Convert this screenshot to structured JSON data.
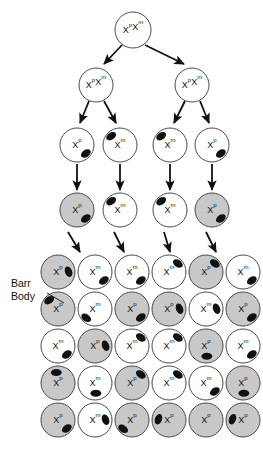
{
  "diagram": {
    "colors": {
      "cell_fill_white": "#ffffff",
      "cell_fill_gray": "#c8c8c8",
      "cell_stroke": "#4a4a4a",
      "barr_body": "#111111",
      "arrow": "#111111",
      "text": "#111111"
    },
    "annotation": {
      "label_line1": "Barr",
      "label_line2": "Body"
    },
    "labels": {
      "xp_xm": "XpXm",
      "xp": "Xp",
      "xm": "Xm"
    },
    "rows": {
      "zygote": [
        {
          "id": "z1",
          "x": 133,
          "y": 30,
          "r": 18,
          "fill": "white",
          "base": "X",
          "sup1": "p",
          "base2": "X",
          "sup2": "m",
          "barr": null
        }
      ],
      "generation1": [
        {
          "id": "g1a",
          "x": 96,
          "y": 85,
          "r": 17,
          "fill": "white",
          "base": "X",
          "sup1": "p",
          "base2": "X",
          "sup2": "m",
          "barr": null
        },
        {
          "id": "g1b",
          "x": 192,
          "y": 85,
          "r": 17,
          "fill": "white",
          "base": "X",
          "sup1": "p",
          "base2": "X",
          "sup2": "m",
          "barr": null
        }
      ],
      "generation2": [
        {
          "id": "g2a",
          "x": 77,
          "y": 145,
          "r": 17,
          "fill": "white",
          "base": "X",
          "sup1": "p",
          "barr": "br"
        },
        {
          "id": "g2b",
          "x": 120,
          "y": 145,
          "r": 17,
          "fill": "white",
          "base": "X",
          "sup1": "m",
          "barr": "tl"
        },
        {
          "id": "g2c",
          "x": 170,
          "y": 145,
          "r": 17,
          "fill": "white",
          "base": "X",
          "sup1": "m",
          "barr": "tl"
        },
        {
          "id": "g2d",
          "x": 212,
          "y": 145,
          "r": 17,
          "fill": "white",
          "base": "X",
          "sup1": "p",
          "barr": "br"
        }
      ],
      "generation3": [
        {
          "id": "g3a",
          "x": 77,
          "y": 210,
          "r": 17,
          "fill": "gray",
          "base": "X",
          "sup1": "p",
          "barr": "br"
        },
        {
          "id": "g3b",
          "x": 120,
          "y": 210,
          "r": 17,
          "fill": "white",
          "base": "X",
          "sup1": "m",
          "barr": "tl"
        },
        {
          "id": "g3c",
          "x": 170,
          "y": 210,
          "r": 17,
          "fill": "white",
          "base": "X",
          "sup1": "m",
          "barr": "tl"
        },
        {
          "id": "g3d",
          "x": 212,
          "y": 210,
          "r": 17,
          "fill": "gray",
          "base": "X",
          "sup1": "p",
          "barr": "br"
        }
      ]
    },
    "tissue_grid": {
      "columns": 6,
      "rows": 5,
      "x_start": 58,
      "x_step": 37,
      "y_start": 272,
      "y_step": 37,
      "radius": 17,
      "cells": [
        [
          {
            "fill": "gray",
            "base": "X",
            "sup1": "p",
            "barr": "r"
          },
          {
            "fill": "white",
            "base": "X",
            "sup1": "m",
            "barr": "br"
          },
          {
            "fill": "white",
            "base": "X",
            "sup1": "m",
            "barr": "br"
          },
          {
            "fill": "white",
            "base": "X",
            "sup1": "m",
            "barr": "tr"
          },
          {
            "fill": "gray",
            "base": "X",
            "sup1": "p",
            "barr": "tr"
          },
          {
            "fill": "white",
            "base": "X",
            "sup1": "m",
            "barr": "br"
          }
        ],
        [
          {
            "fill": "gray",
            "base": "X",
            "sup1": "p",
            "barr": "tl"
          },
          {
            "fill": "white",
            "base": "X",
            "sup1": "m",
            "barr": "bl"
          },
          {
            "fill": "gray",
            "base": "X",
            "sup1": "p",
            "barr": "br"
          },
          {
            "fill": "gray",
            "base": "X",
            "sup1": "p",
            "barr": "r"
          },
          {
            "fill": "white",
            "base": "X",
            "sup1": "m",
            "barr": "r"
          },
          {
            "fill": "gray",
            "base": "X",
            "sup1": "p",
            "barr": "br"
          }
        ],
        [
          {
            "fill": "white",
            "base": "X",
            "sup1": "m",
            "barr": "br"
          },
          {
            "fill": "gray",
            "base": "X",
            "sup1": "p",
            "barr": "r"
          },
          {
            "fill": "white",
            "base": "X",
            "sup1": "m",
            "barr": "tr"
          },
          {
            "fill": "white",
            "base": "X",
            "sup1": "m",
            "barr": "tr"
          },
          {
            "fill": "gray",
            "base": "X",
            "sup1": "p",
            "barr": "b"
          },
          {
            "fill": "white",
            "base": "X",
            "sup1": "m",
            "barr": "br"
          }
        ],
        [
          {
            "fill": "gray",
            "base": "X",
            "sup1": "p",
            "barr": "t"
          },
          {
            "fill": "white",
            "base": "X",
            "sup1": "m",
            "barr": "b"
          },
          {
            "fill": "gray",
            "base": "X",
            "sup1": "p",
            "barr": "tr"
          },
          {
            "fill": "white",
            "base": "X",
            "sup1": "m",
            "barr": "tr"
          },
          {
            "fill": "white",
            "base": "X",
            "sup1": "m",
            "barr": "br"
          },
          {
            "fill": "gray",
            "base": "X",
            "sup1": "p",
            "barr": "b"
          }
        ],
        [
          {
            "fill": "gray",
            "base": "X",
            "sup1": "p",
            "barr": "br"
          },
          {
            "fill": "white",
            "base": "X",
            "sup1": "m",
            "barr": "r"
          },
          {
            "fill": "gray",
            "base": "X",
            "sup1": "p",
            "barr": "bl"
          },
          {
            "fill": "gray",
            "base": "X",
            "sup1": "p",
            "barr": "l"
          },
          {
            "fill": "gray",
            "base": "X",
            "sup1": "p",
            "barr": null
          },
          {
            "fill": "gray",
            "base": "X",
            "sup1": "p",
            "barr": "l"
          }
        ]
      ]
    },
    "connectors": {
      "zygote_to_gen1": [
        {
          "x1": 122,
          "y1": 45,
          "x2": 104,
          "y2": 64
        },
        {
          "x1": 145,
          "y1": 45,
          "x2": 184,
          "y2": 64
        }
      ],
      "gen1_to_gen2": [
        {
          "x1": 89,
          "y1": 101,
          "x2": 80,
          "y2": 123
        },
        {
          "x1": 104,
          "y1": 101,
          "x2": 116,
          "y2": 123
        },
        {
          "x1": 185,
          "y1": 101,
          "x2": 174,
          "y2": 123
        },
        {
          "x1": 200,
          "y1": 101,
          "x2": 209,
          "y2": 123
        }
      ],
      "gen2_to_gen3": [
        {
          "x1": 77,
          "y1": 164,
          "x2": 77,
          "y2": 190
        },
        {
          "x1": 120,
          "y1": 164,
          "x2": 120,
          "y2": 190
        },
        {
          "x1": 170,
          "y1": 164,
          "x2": 170,
          "y2": 190
        },
        {
          "x1": 212,
          "y1": 164,
          "x2": 212,
          "y2": 190
        }
      ],
      "gen3_to_grid": [
        {
          "x1": 68,
          "y1": 232,
          "x2": 80,
          "y2": 252
        },
        {
          "x1": 114,
          "y1": 232,
          "x2": 124,
          "y2": 252
        },
        {
          "x1": 164,
          "y1": 232,
          "x2": 170,
          "y2": 252
        },
        {
          "x1": 206,
          "y1": 232,
          "x2": 216,
          "y2": 252
        }
      ],
      "barr_pointer": {
        "x1": 47,
        "y1": 293,
        "x2": 64,
        "y2": 303
      }
    }
  }
}
